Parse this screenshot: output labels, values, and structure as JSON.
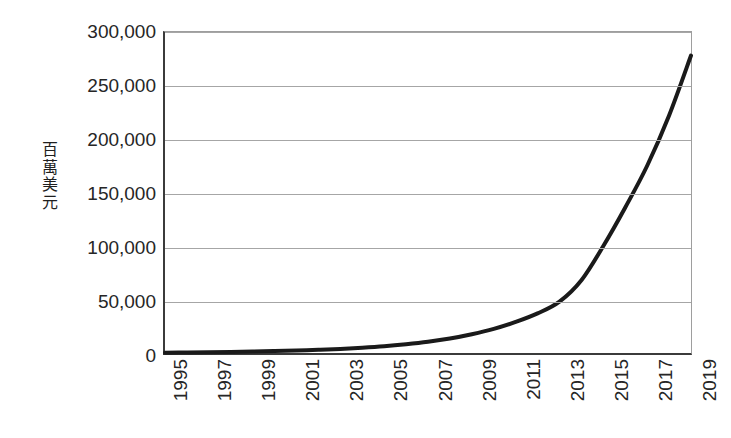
{
  "chart_data": {
    "type": "line",
    "title": "",
    "subtitle": "",
    "xlabel": "",
    "ylabel": "百萬美元",
    "ylabel_chars": "百\n萬\n美\n元",
    "x": [
      1995,
      1996,
      1997,
      1998,
      1999,
      2000,
      2001,
      2002,
      2003,
      2004,
      2005,
      2006,
      2007,
      2008,
      2009,
      2010,
      2011,
      2012,
      2013,
      2014,
      2015,
      2016,
      2017,
      2018,
      2019
    ],
    "values": [
      300,
      450,
      700,
      1000,
      1400,
      1900,
      2400,
      3000,
      3800,
      4900,
      6300,
      8200,
      10500,
      13500,
      17500,
      22500,
      29000,
      37000,
      48000,
      68000,
      100000,
      136000,
      175000,
      222000,
      278000
    ],
    "series": [
      {
        "name": "百萬美元",
        "values": [
          300,
          450,
          700,
          1000,
          1400,
          1900,
          2400,
          3000,
          3800,
          4900,
          6300,
          8200,
          10500,
          13500,
          17500,
          22500,
          29000,
          37000,
          48000,
          68000,
          100000,
          136000,
          175000,
          222000,
          278000
        ]
      }
    ],
    "xtick_labels": [
      "1995",
      "1997",
      "1999",
      "2001",
      "2003",
      "2005",
      "2007",
      "2009",
      "2011",
      "2013",
      "2015",
      "2017",
      "2019"
    ],
    "xtick_values": [
      1995,
      1997,
      1999,
      2001,
      2003,
      2005,
      2007,
      2009,
      2011,
      2013,
      2015,
      2017,
      2019
    ],
    "ytick_labels": [
      "300,000",
      "250,000",
      "200,000",
      "150,000",
      "100,000",
      "50,000",
      "0"
    ],
    "ytick_values": [
      300000,
      250000,
      200000,
      150000,
      100000,
      50000,
      0
    ],
    "ylim": [
      0,
      300000
    ],
    "xlim": [
      1995,
      2019
    ],
    "grid": true,
    "grid_axis": "y",
    "legend": false,
    "legend_position": "none",
    "line_color": "#1a1a1a",
    "line_width": 4,
    "gridline_color": "#a6a6a6",
    "axis_color": "#3b3b3b",
    "background_color": "#ffffff",
    "text_color": "#262626",
    "annotations": []
  }
}
